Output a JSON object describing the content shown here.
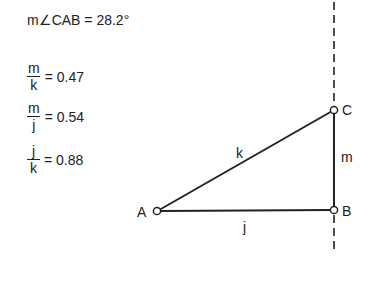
{
  "measurements": {
    "angle": {
      "label": "m∠CAB = 28.2°"
    },
    "ratios": [
      {
        "numerator": "m",
        "denominator": "k",
        "value": "= 0.47"
      },
      {
        "numerator": "m",
        "denominator": "j",
        "value": "= 0.54"
      },
      {
        "numerator": "j",
        "denominator": "k",
        "value": "= 0.88"
      }
    ]
  },
  "figure": {
    "points": [
      {
        "name": "A",
        "x": 157,
        "y": 211
      },
      {
        "name": "B",
        "x": 334,
        "y": 210
      },
      {
        "name": "C",
        "x": 334,
        "y": 110
      }
    ],
    "segments": [
      {
        "name": "k",
        "from": "A",
        "to": "C"
      },
      {
        "name": "j",
        "from": "A",
        "to": "B"
      },
      {
        "name": "m",
        "from": "B",
        "to": "C"
      }
    ],
    "labels": {
      "A": "A",
      "B": "B",
      "C": "C",
      "k": "k",
      "j": "j",
      "m": "m"
    },
    "dashed_line": {
      "description": "vertical line through B and C",
      "x": 334
    },
    "colors": {
      "stroke": "#222222",
      "background": "#ffffff"
    }
  }
}
